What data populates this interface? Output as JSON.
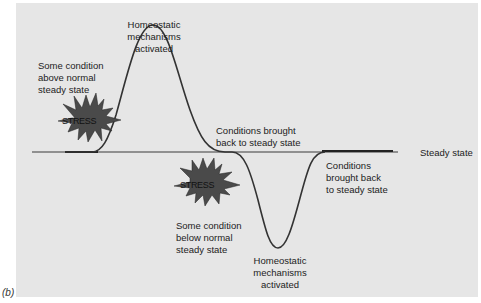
{
  "figure_label": "(b)",
  "steady_state_label": "Steady state",
  "stress_label": "STRESS",
  "labels": {
    "upper_activation": [
      "Homeostatic",
      "mechanisms",
      "activated"
    ],
    "above_normal": [
      "Some condition",
      "above normal",
      "steady state"
    ],
    "back_upper": [
      "Conditions brought",
      "back to steady state"
    ],
    "back_lower": [
      "Conditions",
      "brought back",
      "to steady state"
    ],
    "below_normal": [
      "Some condition",
      "below normal",
      "steady state"
    ],
    "lower_activation": [
      "Homeostatic",
      "mechanisms",
      "activated"
    ]
  },
  "colors": {
    "background": "#e6e6e6",
    "curve": "#333333",
    "star_fill": "#4a4a4a"
  }
}
